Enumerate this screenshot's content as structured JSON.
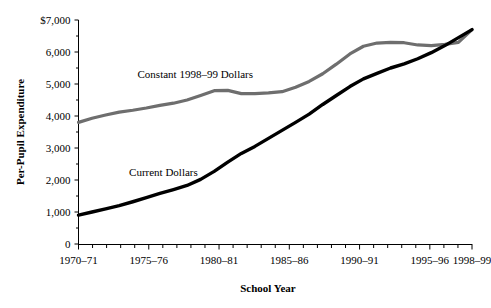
{
  "chart_data": {
    "type": "line",
    "title": "",
    "xlabel": "School Year",
    "ylabel": "Per-Pupil Expenditure",
    "ylim": [
      0,
      7000
    ],
    "grid": false,
    "legend_position": "inline-annotation",
    "y_ticks": [
      "0",
      "1,000",
      "2,000",
      "3,000",
      "4,000",
      "5,000",
      "6,000",
      "$7,000"
    ],
    "y_tick_values": [
      0,
      1000,
      2000,
      3000,
      4000,
      5000,
      6000,
      7000
    ],
    "y_minor_ticks": [
      500,
      1500,
      2500,
      3500,
      4500,
      5500,
      6500
    ],
    "x_tick_labels": [
      "1970–71",
      "1975–76",
      "1980–81",
      "1985–86",
      "1990–91",
      "1995–96",
      "1998–99"
    ],
    "x_tick_label_years": [
      1970,
      1975,
      1980,
      1985,
      1990,
      1995,
      1998
    ],
    "x_all_years": [
      1970,
      1971,
      1972,
      1973,
      1974,
      1975,
      1976,
      1977,
      1978,
      1979,
      1980,
      1981,
      1982,
      1983,
      1984,
      1985,
      1986,
      1987,
      1988,
      1989,
      1990,
      1991,
      1992,
      1993,
      1994,
      1995,
      1996,
      1997,
      1998
    ],
    "xlim": [
      1970,
      1998
    ],
    "series": [
      {
        "name": "Constant 1998–99 Dollars",
        "color": "#6e6e6e",
        "label_x_year": 1974.2,
        "label_y_value": 5180,
        "values": [
          3800,
          3930,
          4030,
          4120,
          4180,
          4250,
          4330,
          4400,
          4500,
          4640,
          4790,
          4800,
          4700,
          4700,
          4720,
          4760,
          4900,
          5080,
          5320,
          5620,
          5940,
          6180,
          6280,
          6300,
          6290,
          6220,
          6200,
          6240,
          6300,
          6700
        ]
      },
      {
        "name": "Current Dollars",
        "color": "#000000",
        "label_x_year": 1973.6,
        "label_y_value": 2130,
        "values": [
          900,
          1000,
          1100,
          1200,
          1320,
          1450,
          1580,
          1700,
          1830,
          2020,
          2270,
          2560,
          2830,
          3050,
          3300,
          3550,
          3800,
          4060,
          4360,
          4640,
          4920,
          5160,
          5330,
          5500,
          5630,
          5790,
          5980,
          6200,
          6450,
          6700
        ]
      }
    ]
  }
}
